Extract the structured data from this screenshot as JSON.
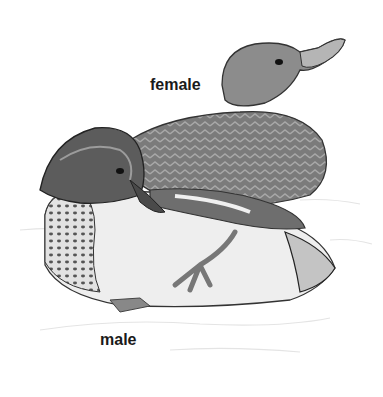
{
  "illustration": {
    "subject": "two ducks (teal), grayscale illustration",
    "labels": {
      "female": "female",
      "male": "male"
    },
    "colors": {
      "background": "#ffffff",
      "label_text": "#1a1a1a",
      "female_head": "#8a8a8a",
      "female_body": "#7a7a7a",
      "male_head": "#5a5a5a",
      "male_breast": "#d8d8d8",
      "male_belly": "#eeeeee"
    }
  }
}
